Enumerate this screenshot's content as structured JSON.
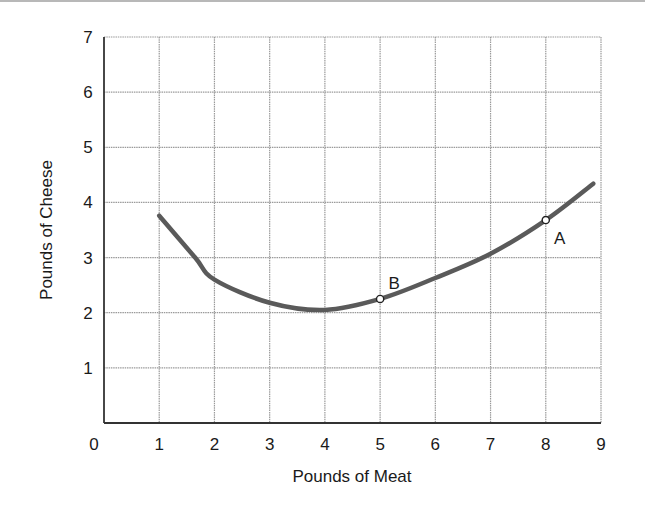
{
  "chart_data": {
    "type": "line",
    "title": "",
    "xlabel": "Pounds of Meat",
    "ylabel": "Pounds of Cheese",
    "xlim": [
      0,
      9
    ],
    "ylim": [
      0,
      7
    ],
    "x_ticks": [
      "0",
      "1",
      "2",
      "3",
      "4",
      "5",
      "6",
      "7",
      "8",
      "9"
    ],
    "y_ticks": [
      "1",
      "2",
      "3",
      "4",
      "5",
      "6",
      "7"
    ],
    "grid": true,
    "legend": null,
    "series": [
      {
        "name": "curve",
        "x": [
          1.0,
          1.65,
          2.0,
          3.0,
          4.0,
          5.0,
          6.0,
          7.0,
          8.0,
          8.86
        ],
        "y": [
          3.76,
          3.0,
          2.6,
          2.18,
          2.05,
          2.25,
          2.63,
          3.07,
          3.68,
          4.34
        ]
      }
    ],
    "annotations": [
      {
        "label": "A",
        "x": 8,
        "y": 3.68
      },
      {
        "label": "B",
        "x": 5,
        "y": 2.25
      }
    ]
  },
  "colors": {
    "curve": "#5a5a5a",
    "grid": "#9a9a9a",
    "axis": "#333333",
    "text": "#1a1a1a"
  }
}
